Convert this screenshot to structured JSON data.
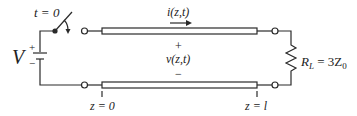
{
  "diagram": {
    "type": "transmission-line-circuit",
    "switch": {
      "label": "t = 0"
    },
    "source": {
      "label": "V",
      "plus": "+",
      "minus": "−"
    },
    "current": {
      "label": "i(z,t)"
    },
    "voltage": {
      "plus": "+",
      "label": "v(z,t)",
      "minus": "−"
    },
    "positions": {
      "left": "z = 0",
      "right": "z = l"
    },
    "load": {
      "label": "R",
      "sub": "L",
      "eq": " = 3Z",
      "eqsub": "0"
    },
    "colors": {
      "stroke": "#2a2a2a",
      "background": "#ffffff"
    }
  }
}
